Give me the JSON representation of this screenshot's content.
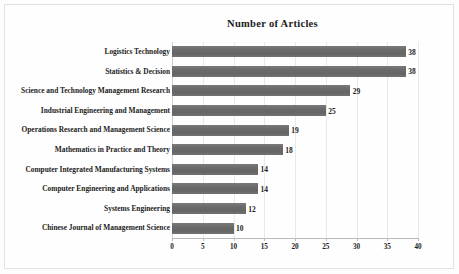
{
  "chart_data": {
    "type": "bar",
    "orientation": "horizontal",
    "title": "Number of Articles",
    "xlabel": "",
    "ylabel": "",
    "xlim": [
      0,
      40
    ],
    "xticks": [
      0,
      5,
      10,
      15,
      20,
      25,
      30,
      35,
      40
    ],
    "grid": true,
    "legend": false,
    "bar_color": "#6e6e6e",
    "categories": [
      "Logistics Technology",
      "Statistics & Decision",
      "Science and Technology Management Research",
      "Industrial Engineering and Management",
      "Operations Research and Management Science",
      "Mathematics in Practice and Theory",
      "Computer Integrated Manufacturing Systems",
      "Computer Engineering and Applications",
      "Systems Engineering",
      "Chinese Journal of Management Science"
    ],
    "values": [
      38,
      38,
      29,
      25,
      19,
      18,
      14,
      14,
      12,
      10
    ],
    "data_labels": [
      "38",
      "38",
      "29",
      "25",
      "19",
      "18",
      "14",
      "14",
      "12",
      "10"
    ]
  }
}
